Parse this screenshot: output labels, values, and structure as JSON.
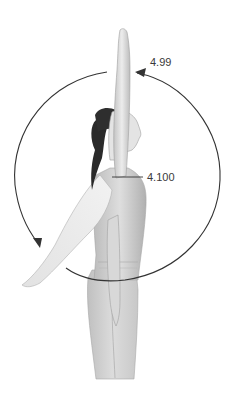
{
  "figure": {
    "labels": [
      {
        "id": "top",
        "text": "4.99"
      },
      {
        "id": "mid",
        "text": "4.100"
      }
    ],
    "colors": {
      "background": "#ffffff",
      "skin_light": "#e8e8e8",
      "skin_mid": "#c9c9c9",
      "skin_shadow": "#9a9a9a",
      "hair": "#2a2a2a",
      "line": "#333333",
      "label_text": "#3a3a3a"
    }
  }
}
